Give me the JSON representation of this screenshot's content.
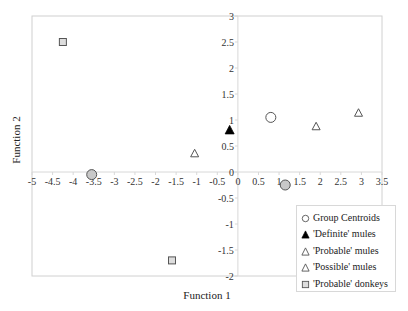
{
  "chart_data": {
    "type": "scatter",
    "title": "",
    "xlabel": "Function 1",
    "ylabel": "Function 2",
    "xlim": [
      -5,
      3.5
    ],
    "ylim": [
      -2,
      3
    ],
    "x_ticks": [
      "-5",
      "-4.5",
      "-4",
      "-3.5",
      "-3",
      "-2.5",
      "-2",
      "-1.5",
      "-1",
      "-0.5",
      "0",
      "0.5",
      "1",
      "1.5",
      "2",
      "2.5",
      "3",
      "3.5"
    ],
    "y_ticks": [
      "3",
      "2.5",
      "2",
      "1.5",
      "1",
      "0.5",
      "0",
      "-0.5",
      "-1",
      "-1.5",
      "-2"
    ],
    "grid": false,
    "legend_position": "bottom-right",
    "series": [
      {
        "name": "Group Centroids",
        "marker": "circle",
        "points": [
          {
            "x": -3.55,
            "y": -0.05,
            "fill": "#c8c8c8"
          },
          {
            "x": 0.8,
            "y": 1.05,
            "fill": "#ffffff"
          },
          {
            "x": 1.15,
            "y": -0.25,
            "fill": "#c8c8c8"
          }
        ]
      },
      {
        "name": "'Definite' mules",
        "marker": "triangle-filled",
        "points": [
          {
            "x": -0.2,
            "y": 0.8
          }
        ]
      },
      {
        "name": "'Probable' mules",
        "marker": "triangle-open",
        "points": [
          {
            "x": 1.9,
            "y": 0.87
          },
          {
            "x": 2.93,
            "y": 1.13
          }
        ]
      },
      {
        "name": "'Possible' mules",
        "marker": "triangle-open",
        "points": [
          {
            "x": -1.05,
            "y": 0.35
          }
        ]
      },
      {
        "name": "'Probable' donkeys",
        "marker": "square",
        "points": [
          {
            "x": -4.25,
            "y": 2.5
          },
          {
            "x": -1.6,
            "y": -1.7
          }
        ]
      }
    ]
  },
  "legend": {
    "items": [
      {
        "label": "Group Centroids",
        "icon": "circle-icon"
      },
      {
        "label": "'Definite' mules",
        "icon": "filled-triangle-icon"
      },
      {
        "label": "'Probable' mules",
        "icon": "open-triangle-icon"
      },
      {
        "label": "'Possible' mules",
        "icon": "open-triangle-icon"
      },
      {
        "label": "'Probable' donkeys",
        "icon": "square-icon"
      }
    ]
  },
  "colors": {
    "frame": "#d0d0d0",
    "axis": "#d8d8d8",
    "marker_stroke": "#555555",
    "centroid_fill": "#c8c8c8",
    "donkey_fill": "#dddddd",
    "definite_fill": "#000000"
  }
}
